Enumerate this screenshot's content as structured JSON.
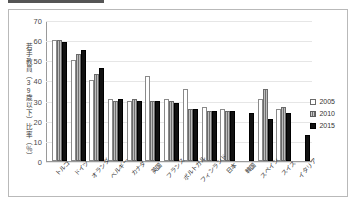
{
  "chart_data": {
    "type": "bar",
    "title": "",
    "xlabel": "",
    "ylabel": "若手教員（39歳以下）比率（％）",
    "ylim": [
      0,
      70
    ],
    "ytick_step": 10,
    "yticks": [
      "70",
      "60",
      "50",
      "40",
      "30",
      "20",
      "10",
      "0"
    ],
    "grid": true,
    "legend_position": "right",
    "categories": [
      "トルコ",
      "ドイツ",
      "オランダ",
      "ベルギー",
      "カナダ",
      "英国",
      "フランス",
      "ポルトガル",
      "フィンランド",
      "日本",
      "韓国",
      "スペイン",
      "スイス",
      "イタリア"
    ],
    "series": [
      {
        "name": "2005",
        "color": "#ffffff",
        "values": [
          60,
          50,
          40,
          31,
          30,
          42,
          31,
          36,
          27,
          26,
          null,
          31,
          26,
          null
        ]
      },
      {
        "name": "2010",
        "color": "#8a8a8a",
        "values": [
          60,
          53,
          43,
          30,
          31,
          30,
          30,
          26,
          25,
          25,
          null,
          36,
          27,
          null
        ]
      },
      {
        "name": "2015",
        "color": "#111111",
        "values": [
          59,
          55,
          46,
          31,
          30,
          30,
          29,
          26,
          25,
          25,
          24,
          21,
          24,
          13
        ]
      }
    ]
  },
  "legend": {
    "items": [
      {
        "label": "2005"
      },
      {
        "label": "2010"
      },
      {
        "label": "2015"
      }
    ]
  }
}
